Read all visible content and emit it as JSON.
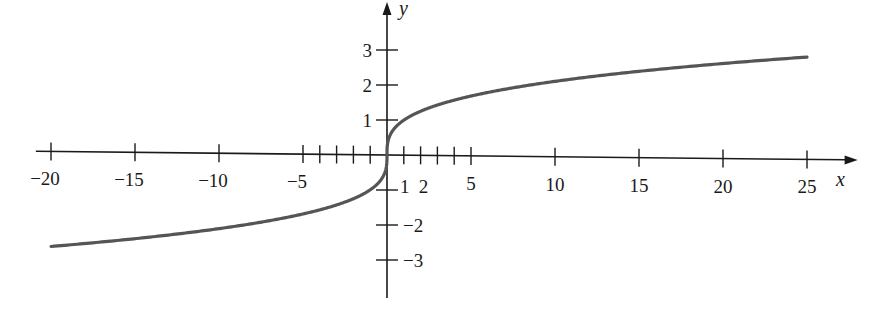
{
  "chart_data": {
    "type": "line",
    "title": "",
    "function": "y = cube root of x",
    "xlabel": "x",
    "ylabel": "y",
    "xlim": [
      -20,
      26
    ],
    "ylim": [
      -3.8,
      4
    ],
    "grid": false,
    "legend": null,
    "x_ticks_labeled": [
      {
        "v": -20,
        "label": "−20"
      },
      {
        "v": -15,
        "label": "−15"
      },
      {
        "v": -10,
        "label": "−10"
      },
      {
        "v": -5,
        "label": "−5"
      },
      {
        "v": 1,
        "label": "1"
      },
      {
        "v": 2,
        "label": "2"
      },
      {
        "v": 5,
        "label": "5"
      },
      {
        "v": 10,
        "label": "10"
      },
      {
        "v": 15,
        "label": "15"
      },
      {
        "v": 20,
        "label": "20"
      },
      {
        "v": 25,
        "label": "25"
      }
    ],
    "x_ticks_minor": [
      -4,
      -3,
      -2,
      -1,
      3,
      4
    ],
    "y_ticks_labeled": [
      {
        "v": 3,
        "label": "3"
      },
      {
        "v": 2,
        "label": "2"
      },
      {
        "v": 1,
        "label": "1"
      },
      {
        "v": -2,
        "label": "−2"
      },
      {
        "v": -3,
        "label": "−3"
      }
    ],
    "y_ticks_minor": [
      -1
    ],
    "series": [
      {
        "name": "y = x^(1/3)",
        "color": "#555555",
        "x": [
          -20,
          -15,
          -10,
          -5,
          -2,
          -1,
          -0.5,
          -0.1,
          0,
          0.1,
          0.5,
          1,
          2,
          5,
          10,
          15,
          20,
          25
        ],
        "y": [
          -2.71,
          -2.47,
          -2.15,
          -1.71,
          -1.26,
          -1.0,
          -0.79,
          -0.46,
          0,
          0.46,
          0.79,
          1.0,
          1.26,
          1.71,
          2.15,
          2.47,
          2.71,
          2.92
        ]
      }
    ]
  }
}
